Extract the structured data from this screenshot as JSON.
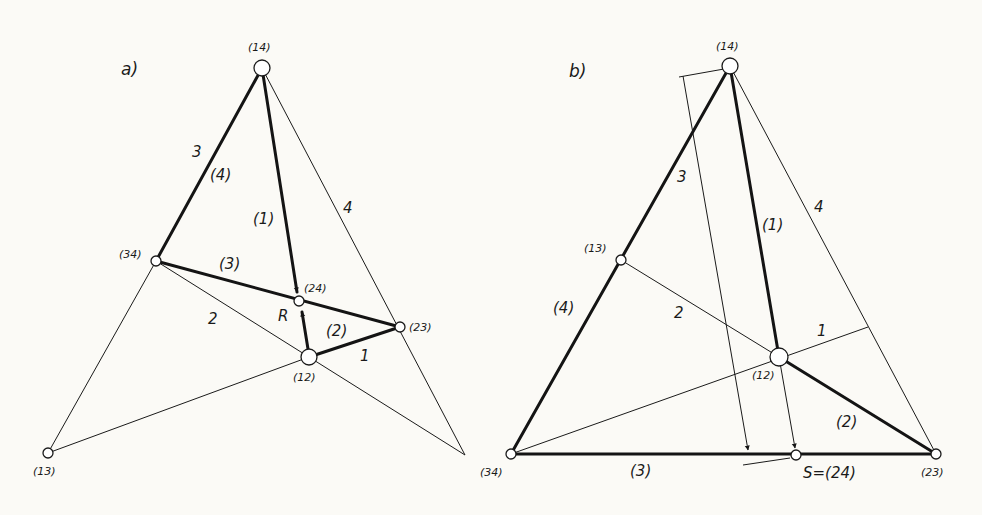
{
  "panels": {
    "a": {
      "title": "a)",
      "nodes": {
        "n14": "(14)",
        "n34": "(34)",
        "n24": "(24)",
        "n23": "(23)",
        "n12": "(12)",
        "n13": "(13)"
      },
      "labels": {
        "edge3": "3",
        "edge4_paren": "(4)",
        "edge1_paren": "(1)",
        "edge4": "4",
        "edge3_paren": "(3)",
        "edge2": "2",
        "point_R": "R",
        "edge2_paren": "(2)",
        "edge1": "1"
      }
    },
    "b": {
      "title": "b)",
      "nodes": {
        "n14": "(14)",
        "n13": "(13)",
        "n12": "(12)",
        "n34": "(34)",
        "n23": "(23)",
        "nS": "S=(24)"
      },
      "labels": {
        "edge3": "3",
        "edge1_paren": "(1)",
        "edge4": "4",
        "edge4_paren": "(4)",
        "edge2": "2",
        "edge1": "1",
        "edge2_paren": "(2)",
        "edge3_paren": "(3)"
      }
    }
  }
}
